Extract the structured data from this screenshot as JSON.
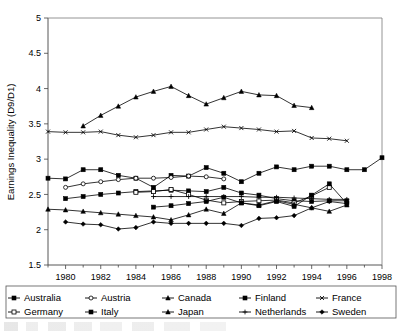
{
  "chart_data": {
    "type": "line",
    "title": "",
    "xlabel": "",
    "ylabel": "Earnings Inequality (D9/D1)",
    "xlim": [
      1979,
      1998
    ],
    "ylim": [
      1.5,
      5
    ],
    "ytick_labels": [
      "5",
      "4.5",
      "4",
      "3.5",
      "3",
      "2.5",
      "2",
      "1.5"
    ],
    "ytick_values": [
      5,
      4.5,
      4,
      3.5,
      3,
      2.5,
      2,
      1.5
    ],
    "xtick_labels": [
      "1980",
      "1982",
      "1984",
      "1986",
      "1988",
      "1990",
      "1992",
      "1994",
      "1996",
      "1998"
    ],
    "xtick_values": [
      1980,
      1982,
      1984,
      1986,
      1988,
      1990,
      1992,
      1994,
      1996,
      1998
    ],
    "grid": false,
    "legend_position": "below-plot",
    "legend_columns": 5,
    "series": [
      {
        "name": "Australia",
        "marker": "filled-square",
        "x": [
          1979,
          1980,
          1981,
          1982,
          1983,
          1984,
          1985,
          1986,
          1987,
          1988,
          1989,
          1990,
          1991,
          1992,
          1993,
          1994,
          1995,
          1996,
          1997,
          1998
        ],
        "values": [
          2.73,
          2.72,
          2.85,
          2.85,
          2.77,
          2.73,
          2.6,
          2.77,
          2.76,
          2.88,
          2.8,
          2.68,
          2.8,
          2.89,
          2.85,
          2.9,
          2.9,
          2.85,
          2.85,
          3.02
        ]
      },
      {
        "name": "Austria",
        "marker": "open-circle",
        "x": [
          1980,
          1981,
          1982,
          1983,
          1984,
          1985,
          1986,
          1987,
          1988,
          1989
        ],
        "values": [
          2.6,
          2.65,
          2.68,
          2.71,
          2.73,
          2.73,
          2.74,
          2.76,
          2.75,
          2.72
        ]
      },
      {
        "name": "Canada",
        "marker": "filled-triangle",
        "x": [
          1981,
          1982,
          1983,
          1984,
          1985,
          1986,
          1987,
          1988,
          1989,
          1990,
          1991,
          1992,
          1993,
          1994
        ],
        "values": [
          3.47,
          3.62,
          3.75,
          3.88,
          3.96,
          4.03,
          3.9,
          3.78,
          3.87,
          3.96,
          3.91,
          3.9,
          3.76,
          3.73
        ]
      },
      {
        "name": "Finland",
        "marker": "filled-square",
        "x": [
          1980,
          1981,
          1982,
          1983,
          1984,
          1985,
          1986,
          1987,
          1988,
          1989,
          1990,
          1991,
          1992,
          1993,
          1994,
          1995,
          1996
        ],
        "values": [
          2.44,
          2.47,
          2.5,
          2.52,
          2.54,
          2.55,
          2.56,
          2.55,
          2.54,
          2.6,
          2.52,
          2.49,
          2.44,
          2.41,
          2.4,
          2.41,
          2.41
        ]
      },
      {
        "name": "France",
        "marker": "x-cross",
        "x": [
          1979,
          1980,
          1981,
          1982,
          1983,
          1984,
          1985,
          1986,
          1987,
          1988,
          1989,
          1990,
          1991,
          1992,
          1993,
          1994,
          1995,
          1996
        ],
        "values": [
          3.39,
          3.38,
          3.38,
          3.39,
          3.34,
          3.31,
          3.34,
          3.38,
          3.38,
          3.42,
          3.46,
          3.44,
          3.42,
          3.39,
          3.4,
          3.3,
          3.29,
          3.26
        ]
      },
      {
        "name": "Germany",
        "marker": "open-square",
        "x": [
          1984,
          1985,
          1986,
          1987,
          1988,
          1989,
          1990,
          1991,
          1992,
          1993,
          1994,
          1995
        ],
        "values": [
          2.53,
          2.54,
          2.57,
          2.5,
          2.42,
          2.38,
          2.4,
          2.41,
          2.42,
          2.38,
          2.48,
          2.6
        ]
      },
      {
        "name": "Italy",
        "marker": "filled-square",
        "x": [
          1985,
          1986,
          1987,
          1988,
          1989,
          1990,
          1991,
          1992,
          1993,
          1994,
          1995,
          1996
        ],
        "values": [
          2.32,
          2.34,
          2.37,
          2.4,
          2.46,
          2.38,
          2.34,
          2.4,
          2.33,
          2.49,
          2.65,
          2.37
        ]
      },
      {
        "name": "Japan",
        "marker": "filled-triangle",
        "x": [
          1979,
          1980,
          1981,
          1982,
          1983,
          1984,
          1985,
          1986,
          1987,
          1988,
          1989,
          1990,
          1991,
          1992,
          1993,
          1994,
          1995,
          1996
        ],
        "values": [
          2.29,
          2.28,
          2.26,
          2.24,
          2.22,
          2.2,
          2.18,
          2.14,
          2.21,
          2.29,
          2.23,
          2.38,
          2.35,
          2.41,
          2.36,
          2.31,
          2.26,
          2.35
        ]
      },
      {
        "name": "Netherlands",
        "marker": "plus-cross",
        "x": [
          1985,
          1986,
          1987,
          1988,
          1989,
          1990,
          1991,
          1992,
          1993,
          1994,
          1995,
          1996
        ],
        "values": [
          2.47,
          2.47,
          2.47,
          2.47,
          2.47,
          2.47,
          2.46,
          2.46,
          2.45,
          2.44,
          2.43,
          2.43
        ]
      },
      {
        "name": "Sweden",
        "marker": "filled-diamond",
        "x": [
          1980,
          1981,
          1982,
          1983,
          1984,
          1985,
          1986,
          1987,
          1988,
          1989,
          1990,
          1991,
          1992,
          1993,
          1994,
          1995,
          1996
        ],
        "values": [
          2.11,
          2.08,
          2.07,
          2.01,
          2.03,
          2.11,
          2.09,
          2.09,
          2.09,
          2.09,
          2.06,
          2.16,
          2.17,
          2.2,
          2.31,
          2.4,
          2.37
        ]
      }
    ]
  },
  "legend": {
    "items": [
      {
        "label": "Australia"
      },
      {
        "label": "Austria"
      },
      {
        "label": "Canada"
      },
      {
        "label": "Finland"
      },
      {
        "label": "France"
      },
      {
        "label": "Germany"
      },
      {
        "label": "Italy"
      },
      {
        "label": "Japan"
      },
      {
        "label": "Netherlands"
      },
      {
        "label": "Sweden"
      }
    ]
  }
}
